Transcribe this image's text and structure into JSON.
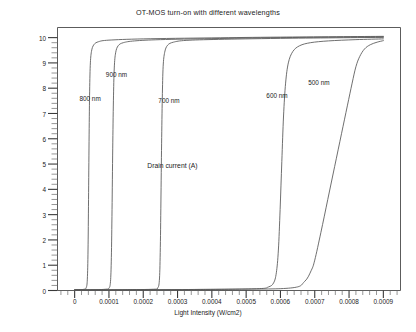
{
  "chart_data": {
    "type": "line",
    "title": "OT-MOS turn-on with different wavelengths",
    "xlabel": "Light Intensity (W/cm2)",
    "ylabel": "Drain current (A)",
    "xlim": [
      -5e-05,
      0.00095
    ],
    "ylim": [
      0,
      10.4
    ],
    "grid": false,
    "legend_position": "inline-annotations",
    "xticks": [
      0,
      0.0001,
      0.0002,
      0.0003,
      0.0004,
      0.0005,
      0.0006,
      0.0007,
      0.0008,
      0.0009
    ],
    "xtick_labels": [
      "0",
      "0.0001",
      "0.0002",
      "0.0003",
      "0.0004",
      "0.0005",
      "0.0006",
      "0.0007",
      "0.0008",
      "0.0009"
    ],
    "yticks": [
      0,
      1,
      2,
      3,
      4,
      5,
      6,
      7,
      8,
      9,
      10
    ],
    "ytick_labels": [
      "0",
      "1",
      "2",
      "3",
      "4",
      "5",
      "6",
      "7",
      "8",
      "9",
      "10"
    ],
    "x_minor_ticks_per_major": 5,
    "y_minor_ticks_per_major": 5,
    "series": [
      {
        "name": "800 nm",
        "label": "800 nm",
        "color": "#555555",
        "annotation": {
          "x": 4.5e-05,
          "y": 7.6
        },
        "points": [
          [
            0.0,
            0.02
          ],
          [
            1.5e-05,
            0.03
          ],
          [
            2.8e-05,
            0.05
          ],
          [
            3.4e-05,
            0.12
          ],
          [
            3.7e-05,
            0.45
          ],
          [
            3.9e-05,
            1.6
          ],
          [
            4.05e-05,
            3.6
          ],
          [
            4.2e-05,
            5.9
          ],
          [
            4.35e-05,
            7.7
          ],
          [
            4.55e-05,
            8.9
          ],
          [
            4.9e-05,
            9.45
          ],
          [
            5.6e-05,
            9.72
          ],
          [
            7e-05,
            9.84
          ],
          [
            0.0001,
            9.9
          ],
          [
            0.0002,
            9.95
          ],
          [
            0.0004,
            9.99
          ],
          [
            0.0006,
            10.02
          ],
          [
            0.0009,
            10.05
          ]
        ]
      },
      {
        "name": "900 nm",
        "label": "900 nm",
        "color": "#555555",
        "annotation": {
          "x": 0.000122,
          "y": 8.55
        },
        "points": [
          [
            0.0,
            0.02
          ],
          [
            6e-05,
            0.03
          ],
          [
            9e-05,
            0.05
          ],
          [
            0.0001,
            0.09
          ],
          [
            0.0001045,
            0.35
          ],
          [
            0.000107,
            1.3
          ],
          [
            0.000109,
            3.2
          ],
          [
            0.000111,
            5.6
          ],
          [
            0.000113,
            7.5
          ],
          [
            0.0001155,
            8.8
          ],
          [
            0.0001195,
            9.4
          ],
          [
            0.000127,
            9.68
          ],
          [
            0.000142,
            9.8
          ],
          [
            0.000175,
            9.87
          ],
          [
            0.00025,
            9.92
          ],
          [
            0.0004,
            9.96
          ],
          [
            0.0006,
            10.0
          ],
          [
            0.0009,
            10.03
          ]
        ]
      },
      {
        "name": "700 nm",
        "label": "700 nm",
        "color": "#555555",
        "annotation": {
          "x": 0.000275,
          "y": 7.55
        },
        "points": [
          [
            0.0,
            0.02
          ],
          [
            0.00014,
            0.03
          ],
          [
            0.00023,
            0.05
          ],
          [
            0.000242,
            0.1
          ],
          [
            0.000247,
            0.4
          ],
          [
            0.0002495,
            1.5
          ],
          [
            0.0002515,
            3.5
          ],
          [
            0.0002535,
            5.8
          ],
          [
            0.0002555,
            7.6
          ],
          [
            0.000258,
            8.85
          ],
          [
            0.0002625,
            9.42
          ],
          [
            0.000271,
            9.7
          ],
          [
            0.000288,
            9.82
          ],
          [
            0.000325,
            9.89
          ],
          [
            0.00042,
            9.93
          ],
          [
            0.0006,
            9.97
          ],
          [
            0.0009,
            10.01
          ]
        ]
      },
      {
        "name": "600 nm",
        "label": "600 nm",
        "color": "#555555",
        "annotation": {
          "x": 0.00059,
          "y": 7.75
        },
        "points": [
          [
            0.0,
            0.02
          ],
          [
            0.00035,
            0.04
          ],
          [
            0.00053,
            0.07
          ],
          [
            0.000565,
            0.14
          ],
          [
            0.00058,
            0.3
          ],
          [
            0.000588,
            0.7
          ],
          [
            0.000594,
            1.6
          ],
          [
            0.000599,
            3.2
          ],
          [
            0.000604,
            5.1
          ],
          [
            0.000609,
            6.9
          ],
          [
            0.000615,
            8.2
          ],
          [
            0.000623,
            9.0
          ],
          [
            0.000636,
            9.45
          ],
          [
            0.000656,
            9.68
          ],
          [
            0.000688,
            9.8
          ],
          [
            0.00074,
            9.87
          ],
          [
            0.00082,
            9.92
          ],
          [
            0.0009,
            9.95
          ]
        ]
      },
      {
        "name": "500 nm",
        "label": "500 nm",
        "color": "#555555",
        "annotation": {
          "x": 0.000712,
          "y": 8.25
        },
        "points": [
          [
            0.0,
            0.02
          ],
          [
            0.00045,
            0.05
          ],
          [
            0.00063,
            0.1
          ],
          [
            0.00067,
            0.35
          ],
          [
            0.00069,
            0.8
          ],
          [
            0.0007,
            1.2
          ],
          [
            0.000718,
            2.3
          ],
          [
            0.000738,
            3.6
          ],
          [
            0.000758,
            4.9
          ],
          [
            0.000778,
            6.2
          ],
          [
            0.000795,
            7.3
          ],
          [
            0.000809,
            8.2
          ],
          [
            0.00082,
            8.85
          ],
          [
            0.000831,
            9.25
          ],
          [
            0.000845,
            9.55
          ],
          [
            0.000862,
            9.72
          ],
          [
            0.000882,
            9.82
          ],
          [
            0.0009,
            9.88
          ]
        ]
      }
    ]
  },
  "icons": {
    "axis_frame": "plot-frame"
  }
}
